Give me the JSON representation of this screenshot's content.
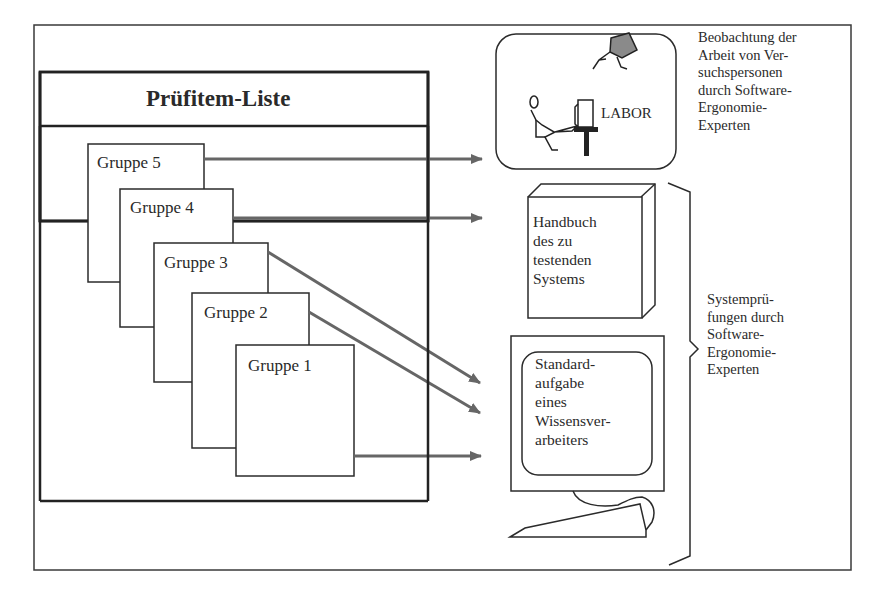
{
  "title": "Prüfitem-Liste",
  "groups": [
    {
      "label": "Gruppe 5"
    },
    {
      "label": "Gruppe 4"
    },
    {
      "label": "Gruppe 3"
    },
    {
      "label": "Gruppe 2"
    },
    {
      "label": "Gruppe 1"
    }
  ],
  "lab": {
    "label": "LABOR",
    "description_lines": [
      "Beobachtung der",
      "Arbeit von Ver-",
      "suchspersonen",
      "durch Software-",
      "Ergonomie-",
      "Experten"
    ]
  },
  "manual": {
    "lines": [
      "Handbuch",
      "des zu",
      "testenden",
      "Systems"
    ]
  },
  "monitor": {
    "lines": [
      "Standard-",
      "aufgabe",
      "eines",
      "Wissensver-",
      "arbeiters"
    ]
  },
  "bracket": {
    "lines": [
      "Systemprü-",
      "fungen durch",
      "Software-",
      "Ergonomie-",
      "Experten"
    ]
  },
  "arrows": [
    {
      "from": "Gruppe 5",
      "to": "LABOR"
    },
    {
      "from": "Gruppe 4",
      "to": "Handbuch des zu testenden Systems"
    },
    {
      "from": "Gruppe 3",
      "to": "Standardaufgabe eines Wissensverarbeiters"
    },
    {
      "from": "Gruppe 2",
      "to": "Standardaufgabe eines Wissensverarbeiters"
    },
    {
      "from": "Gruppe 1",
      "to": "Standardaufgabe eines Wissensverarbeiters"
    }
  ],
  "colors": {
    "line": "#2b2b2b",
    "arrow": "#6a6a6a",
    "camera_fill": "#8a8a8a"
  }
}
